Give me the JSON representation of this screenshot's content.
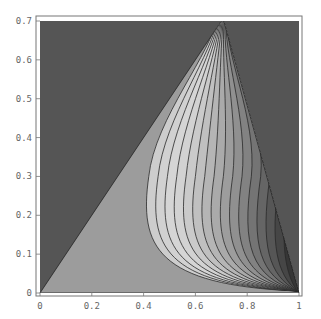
{
  "chart_data": {
    "type": "contour",
    "title": "",
    "xlabel": "",
    "ylabel": "",
    "xlim": [
      0,
      1
    ],
    "ylim": [
      0,
      0.7
    ],
    "x_ticks": [
      "0",
      "0.2",
      "0.4",
      "0.6",
      "0.8",
      "1"
    ],
    "y_ticks": [
      "0",
      "0.1",
      "0.2",
      "0.3",
      "0.4",
      "0.5",
      "0.6",
      "0.7"
    ],
    "grid": false,
    "legend": null,
    "region": {
      "shape": "triangle",
      "vertices": [
        [
          0,
          0
        ],
        [
          0.707,
          0.707
        ],
        [
          1,
          0
        ]
      ]
    },
    "contour_levels": 16,
    "convergence_point": [
      1,
      0
    ],
    "colors": {
      "outside": "#555555",
      "base_band": "#9c9c9c",
      "lightest_band": "#d4d4d4",
      "dark_edge_band": "#3a3a3a",
      "contour_line": "#2a2a2a"
    }
  }
}
